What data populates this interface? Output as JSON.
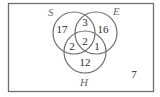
{
  "diagram": {
    "type": "venn",
    "sets": [
      {
        "id": "S",
        "label": "S"
      },
      {
        "id": "E",
        "label": "E"
      },
      {
        "id": "H",
        "label": "H"
      }
    ],
    "regions": {
      "S_only": "17",
      "S_and_E_only": "3",
      "E_only": "16",
      "S_and_H_only": "2",
      "S_E_H": "2",
      "E_and_H_only": "1",
      "H_only": "12",
      "outside": "7"
    },
    "colors": {
      "border": "#6e6e6e",
      "circle": "#6e6e6e",
      "text": "#2a2a2a",
      "set_label": "#6a6a6a"
    }
  }
}
